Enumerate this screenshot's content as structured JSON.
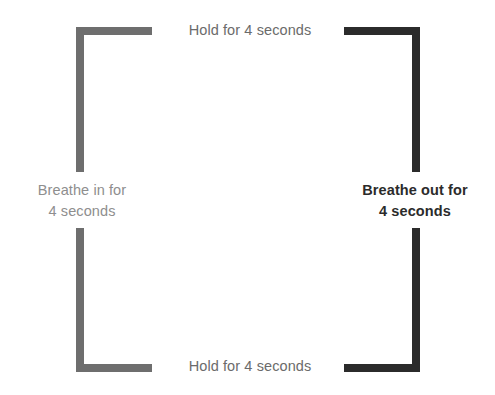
{
  "diagram": {
    "name": "box-breathing-square",
    "canvas": {
      "width": 495,
      "height": 395,
      "background": "#ffffff"
    },
    "colors": {
      "inhale_bracket": "#6e6e6e",
      "exhale_bracket": "#2b2b2b",
      "hold_label_text": "#6b6b6b",
      "inhale_label_text": "#8e8e8e",
      "exhale_label_text": "#2b2b2b"
    },
    "labels": {
      "hold_top": "Hold for 4 seconds",
      "hold_bottom": "Hold for 4 seconds",
      "breathe_in": "Breathe in for\n4 seconds",
      "breathe_out": "Breathe out for\n4 seconds"
    },
    "phases": [
      {
        "position": "left",
        "action": "Breathe in for",
        "duration": "4 seconds",
        "emphasis": "light"
      },
      {
        "position": "top",
        "action": "Hold for",
        "duration": "4 seconds",
        "emphasis": "normal"
      },
      {
        "position": "right",
        "action": "Breathe out for",
        "duration": "4 seconds",
        "emphasis": "bold"
      },
      {
        "position": "bottom",
        "action": "Hold for",
        "duration": "4 seconds",
        "emphasis": "normal"
      }
    ]
  }
}
